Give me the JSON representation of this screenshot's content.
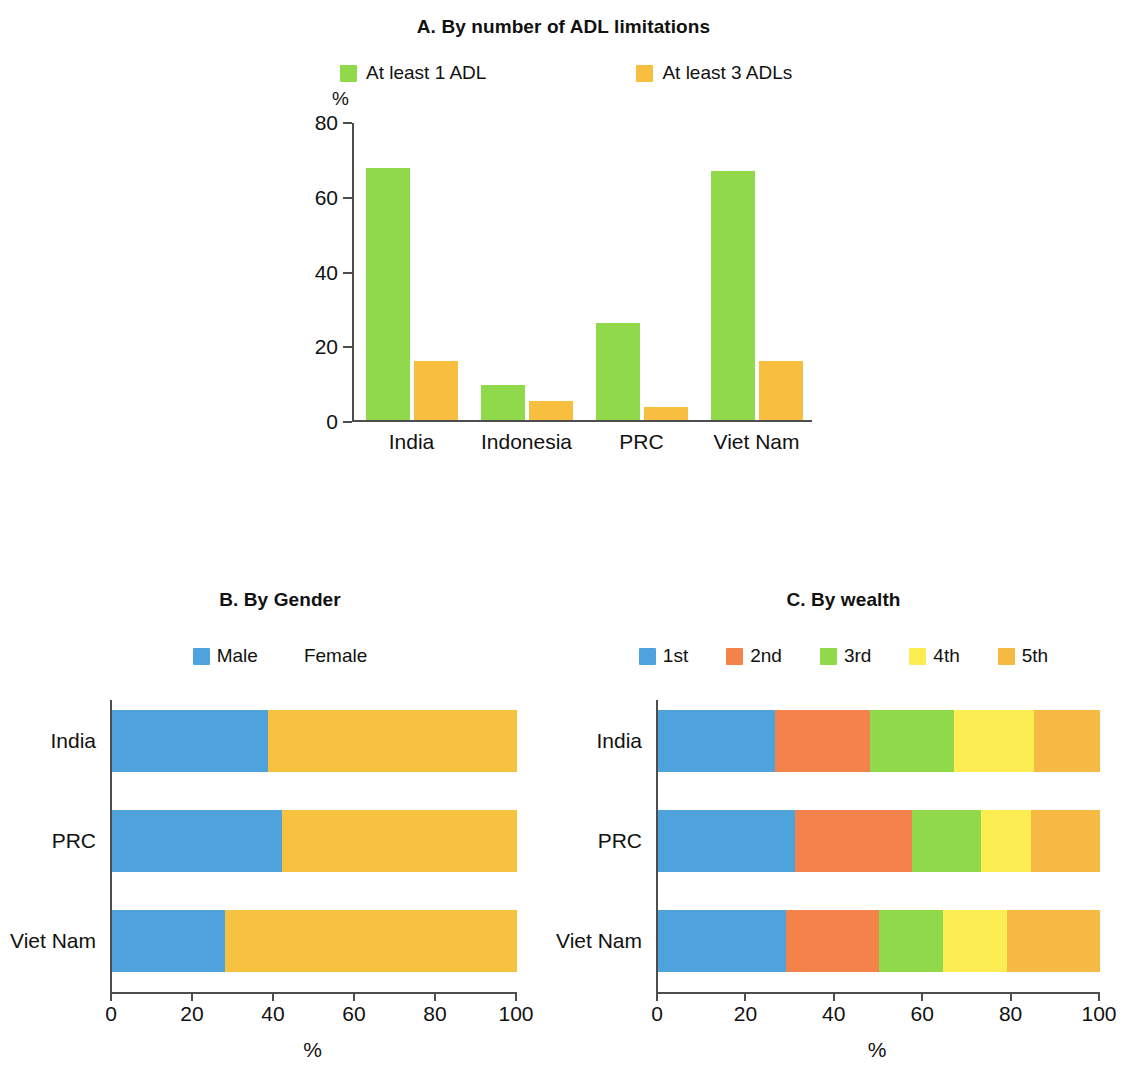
{
  "figure": {
    "panels": [
      "A",
      "B",
      "C"
    ]
  },
  "panelA": {
    "title": "A. By number of ADL limitations",
    "y_unit": "%",
    "legend": [
      {
        "label": "At least 1 ADL",
        "color": "#8FD94A"
      },
      {
        "label": "At least 3 ADLs",
        "color": "#F7BE3F"
      }
    ],
    "y_ticks": [
      "0",
      "20",
      "40",
      "60",
      "80"
    ],
    "categories": [
      "India",
      "Indonesia",
      "PRC",
      "Viet Nam"
    ]
  },
  "panelB": {
    "title": "B. By Gender",
    "x_unit": "%",
    "legend": [
      {
        "label": "Male",
        "color": "#4FA3DC"
      },
      {
        "label": "Female",
        "color": "#F7C council"
      }
    ],
    "x_ticks": [
      "0",
      "20",
      "40",
      "60",
      "80",
      "100"
    ],
    "categories": [
      "India",
      "PRC",
      "Viet Nam"
    ]
  },
  "panelC": {
    "title": "C. By wealth",
    "x_unit": "%",
    "legend": [
      {
        "label": "1st",
        "color": "#4FA3DC"
      },
      {
        "label": "2nd",
        "color": "#F4834B"
      },
      {
        "label": "3rd",
        "color": "#8FD94A"
      },
      {
        "label": "4th",
        "color": "#FCEE52"
      },
      {
        "label": "5th",
        "color": "#F5B944"
      }
    ],
    "x_ticks": [
      "0",
      "20",
      "40",
      "60",
      "80",
      "100"
    ],
    "categories": [
      "India",
      "PRC",
      "Viet Nam"
    ]
  },
  "chart_data": [
    {
      "type": "bar",
      "panel": "A",
      "title": "A. By number of ADL limitations",
      "xlabel": "",
      "ylabel": "%",
      "ylim": [
        0,
        80
      ],
      "yticks": [
        0,
        20,
        40,
        60,
        80
      ],
      "grid": false,
      "legend_position": "top",
      "categories": [
        "India",
        "Indonesia",
        "PRC",
        "Viet Nam"
      ],
      "series": [
        {
          "name": "At least 1 ADL",
          "color": "#8FD94A",
          "values": [
            68,
            9.5,
            26,
            67
          ]
        },
        {
          "name": "At least 3 ADLs",
          "color": "#F7BE3F",
          "values": [
            16,
            5,
            3.5,
            16
          ]
        }
      ]
    },
    {
      "type": "bar",
      "orientation": "horizontal",
      "stacked": true,
      "panel": "B",
      "title": "B. By Gender",
      "xlabel": "%",
      "ylabel": "",
      "xlim": [
        0,
        100
      ],
      "xticks": [
        0,
        20,
        40,
        60,
        80,
        100
      ],
      "grid": false,
      "legend_position": "top",
      "categories": [
        "India",
        "PRC",
        "Viet Nam"
      ],
      "series": [
        {
          "name": "Male",
          "color": "#4FA3DC",
          "values": [
            38.5,
            42,
            28
          ]
        },
        {
          "name": "Female",
          "color": "#F7C23F",
          "values": [
            61.5,
            58,
            72
          ]
        }
      ]
    },
    {
      "type": "bar",
      "orientation": "horizontal",
      "stacked": true,
      "panel": "C",
      "title": "C. By wealth",
      "xlabel": "%",
      "ylabel": "",
      "xlim": [
        0,
        100
      ],
      "xticks": [
        0,
        20,
        40,
        60,
        80,
        100
      ],
      "grid": false,
      "legend_position": "top",
      "categories": [
        "India",
        "PRC",
        "Viet Nam"
      ],
      "series": [
        {
          "name": "1st",
          "color": "#4FA3DC",
          "values": [
            26.5,
            31,
            29
          ]
        },
        {
          "name": "2nd",
          "color": "#F4834B",
          "values": [
            21.5,
            26.5,
            21
          ]
        },
        {
          "name": "3rd",
          "color": "#8FD94A",
          "values": [
            19,
            15.5,
            14.5
          ]
        },
        {
          "name": "4th",
          "color": "#FCEE52",
          "values": [
            18,
            11.5,
            14.5
          ]
        },
        {
          "name": "5th",
          "color": "#F5B944",
          "values": [
            15,
            15.5,
            21
          ]
        }
      ]
    }
  ]
}
